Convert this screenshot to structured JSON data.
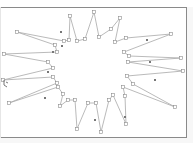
{
  "canvas": {
    "title": "",
    "frame_color": "#8a8a8a",
    "stroke_color": "#a8a8a8",
    "handle_color": "#8c8c8c"
  },
  "shape": {
    "type": "star-polygon",
    "selected": true,
    "points": [
      [
        94,
        12
      ],
      [
        99,
        37
      ],
      [
        111,
        29
      ],
      [
        120,
        18
      ],
      [
        115,
        42
      ],
      [
        126,
        38
      ],
      [
        171,
        34
      ],
      [
        124,
        52
      ],
      [
        129,
        56
      ],
      [
        181,
        58
      ],
      [
        128,
        62
      ],
      [
        183,
        71
      ],
      [
        127,
        76
      ],
      [
        133,
        84
      ],
      [
        175,
        107
      ],
      [
        123,
        87
      ],
      [
        125,
        96
      ],
      [
        126,
        124
      ],
      [
        113,
        95
      ],
      [
        109,
        100
      ],
      [
        101,
        132
      ],
      [
        96,
        103
      ],
      [
        88,
        103
      ],
      [
        77,
        129
      ],
      [
        75,
        100
      ],
      [
        68,
        100
      ],
      [
        60,
        106
      ],
      [
        63,
        94
      ],
      [
        58,
        87
      ],
      [
        9,
        103
      ],
      [
        57,
        83
      ],
      [
        53,
        77
      ],
      [
        3,
        80
      ],
      [
        53,
        68
      ],
      [
        48,
        62
      ],
      [
        4,
        54
      ],
      [
        57,
        52
      ],
      [
        55,
        45
      ],
      [
        17,
        32
      ],
      [
        64,
        41
      ],
      [
        69,
        40
      ],
      [
        70,
        16
      ],
      [
        77,
        41
      ],
      [
        85,
        39
      ]
    ],
    "midpoint_handles": [
      [
        62,
        46
      ],
      [
        61,
        32
      ],
      [
        53,
        52
      ],
      [
        48,
        72
      ],
      [
        45,
        98
      ],
      [
        95,
        120
      ],
      [
        125,
        117
      ],
      [
        150,
        62
      ],
      [
        155,
        80
      ],
      [
        147,
        40
      ]
    ]
  }
}
